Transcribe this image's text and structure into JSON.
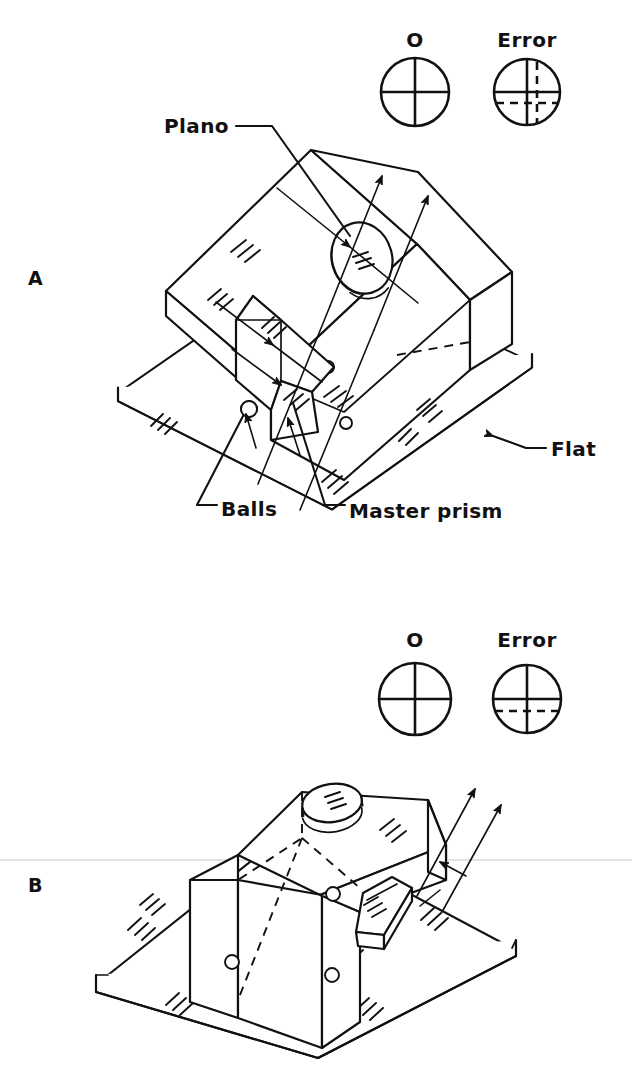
{
  "figure": {
    "panels": [
      {
        "id": "A",
        "label": "A",
        "description": "Prism under test tilted on balls above the flat, master prism alongside, autocollimator rays reflecting off plano",
        "reticles": [
          {
            "label": "O",
            "state": "aligned",
            "description": "Crosshair centered, no offset"
          },
          {
            "label": "Error",
            "state": "offset-both",
            "description": "Dashed crosshair offset in both vertical and horizontal directions"
          }
        ],
        "callouts": [
          {
            "name": "plano",
            "label": "Plano"
          },
          {
            "name": "balls",
            "label": "Balls"
          },
          {
            "name": "master-prism",
            "label": "Master prism"
          },
          {
            "name": "flat",
            "label": "Flat"
          }
        ]
      },
      {
        "id": "B",
        "label": "B",
        "description": "Prism seated flat on the reference flat with plano on top and master prism lying beside it",
        "reticles": [
          {
            "label": "O",
            "state": "aligned",
            "description": "Crosshair centered, no offset"
          },
          {
            "label": "Error",
            "state": "offset-horizontal",
            "description": "Dashed horizontal line offset below the crosshair"
          }
        ],
        "callouts": []
      }
    ],
    "colors": {
      "ink": "#111111",
      "paper": "#ffffff",
      "scan_artifact": "#d8d8d8"
    }
  }
}
